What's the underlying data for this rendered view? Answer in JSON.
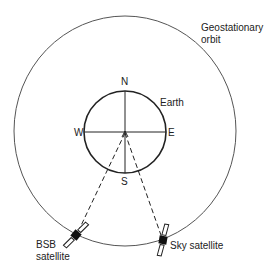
{
  "diagram": {
    "orbit_label_line1": "Geostationary",
    "orbit_label_line2": "orbit",
    "earth_label": "Earth",
    "compass": {
      "north": "N",
      "south": "S",
      "west": "W",
      "east": "E"
    },
    "bsb_label_line1": "BSB",
    "bsb_label_line2": "satellite",
    "sky_label": "Sky satellite",
    "colors": {
      "line": "#222222",
      "orbit": "#555555",
      "background": "#ffffff"
    }
  }
}
